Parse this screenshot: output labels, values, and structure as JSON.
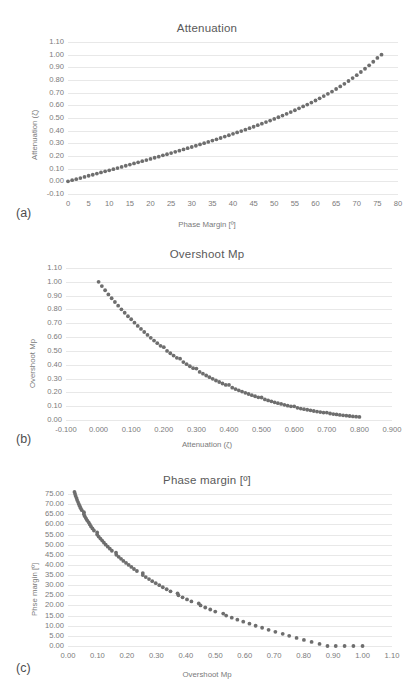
{
  "document": {
    "background": "#ffffff",
    "series_color": "#6e6e6e",
    "grid_color": "#e8e8e8",
    "text_color": "#7a7a7a"
  },
  "figures": [
    {
      "panel": "(a)",
      "chart_data": {
        "type": "scatter",
        "title": "Attenuation",
        "xlabel": "Phase Margin [º]",
        "ylabel": "Attenuation (ζ)",
        "xlim": [
          0,
          80
        ],
        "ylim": [
          -0.1,
          1.1
        ],
        "xticks": [
          "0",
          "5",
          "10",
          "15",
          "20",
          "25",
          "30",
          "35",
          "40",
          "45",
          "50",
          "55",
          "60",
          "65",
          "70",
          "75",
          "80"
        ],
        "yticks": [
          "1.10",
          "1.00",
          "0.90",
          "0.80",
          "0.70",
          "0.60",
          "0.50",
          "0.40",
          "0.30",
          "0.20",
          "0.10",
          "0.00",
          "-0.10"
        ],
        "grid": true,
        "legend": "none",
        "x": [
          0.0,
          1.0,
          2.0,
          3.0,
          4.0,
          5.0,
          6.0,
          7.0,
          8.0,
          9.0,
          10.0,
          11.0,
          12.0,
          13.0,
          14.0,
          15.0,
          16.0,
          17.0,
          18.0,
          19.0,
          20.0,
          21.0,
          22.0,
          23.0,
          24.0,
          25.0,
          26.0,
          27.0,
          28.0,
          29.0,
          30.0,
          31.0,
          32.0,
          33.0,
          34.0,
          35.0,
          36.0,
          37.0,
          38.0,
          39.0,
          40.0,
          41.0,
          42.0,
          43.0,
          44.0,
          45.0,
          46.0,
          47.0,
          48.0,
          49.0,
          50.0,
          51.0,
          52.0,
          53.0,
          54.0,
          55.0,
          56.0,
          57.0,
          58.0,
          59.0,
          60.0,
          61.0,
          62.0,
          63.0,
          64.0,
          65.0,
          66.0,
          67.0,
          68.0,
          69.0,
          70.0,
          71.0,
          72.0,
          73.0,
          74.0,
          75.0,
          76.0
        ],
        "y": [
          0.0,
          0.009,
          0.017,
          0.026,
          0.035,
          0.044,
          0.052,
          0.061,
          0.07,
          0.079,
          0.087,
          0.096,
          0.105,
          0.114,
          0.123,
          0.132,
          0.141,
          0.15,
          0.159,
          0.168,
          0.177,
          0.186,
          0.195,
          0.205,
          0.214,
          0.223,
          0.233,
          0.242,
          0.252,
          0.262,
          0.271,
          0.281,
          0.291,
          0.301,
          0.311,
          0.322,
          0.332,
          0.342,
          0.353,
          0.364,
          0.375,
          0.386,
          0.397,
          0.408,
          0.42,
          0.431,
          0.443,
          0.455,
          0.468,
          0.48,
          0.493,
          0.506,
          0.519,
          0.533,
          0.547,
          0.561,
          0.576,
          0.591,
          0.606,
          0.622,
          0.638,
          0.655,
          0.673,
          0.691,
          0.709,
          0.729,
          0.749,
          0.77,
          0.792,
          0.815,
          0.838,
          0.863,
          0.889,
          0.916,
          0.944,
          0.974,
          1.0
        ]
      }
    },
    {
      "panel": "(b)",
      "chart_data": {
        "type": "scatter",
        "title": "Overshoot Mp",
        "xlabel": "Attenuation (ζ)",
        "ylabel": "Overshoot Mp",
        "xlim": [
          -0.1,
          0.9
        ],
        "ylim": [
          0.0,
          1.1
        ],
        "xticks": [
          "-0.100",
          "0.000",
          "0.100",
          "0.200",
          "0.300",
          "0.400",
          "0.500",
          "0.600",
          "0.700",
          "0.800",
          "0.900"
        ],
        "yticks": [
          "1.10",
          "1.00",
          "0.90",
          "0.80",
          "0.70",
          "0.60",
          "0.50",
          "0.40",
          "0.30",
          "0.20",
          "0.10",
          "0.00"
        ],
        "grid": true,
        "legend": "none",
        "x": [
          0.0,
          0.01,
          0.02,
          0.03,
          0.04,
          0.05,
          0.06,
          0.07,
          0.08,
          0.09,
          0.1,
          0.11,
          0.12,
          0.13,
          0.14,
          0.15,
          0.16,
          0.17,
          0.18,
          0.19,
          0.2,
          0.21,
          0.22,
          0.23,
          0.24,
          0.25,
          0.26,
          0.27,
          0.28,
          0.29,
          0.3,
          0.31,
          0.32,
          0.33,
          0.34,
          0.35,
          0.36,
          0.37,
          0.38,
          0.39,
          0.4,
          0.41,
          0.42,
          0.43,
          0.44,
          0.45,
          0.46,
          0.47,
          0.48,
          0.49,
          0.5,
          0.51,
          0.52,
          0.53,
          0.54,
          0.55,
          0.56,
          0.57,
          0.58,
          0.59,
          0.6,
          0.61,
          0.62,
          0.63,
          0.64,
          0.65,
          0.66,
          0.67,
          0.68,
          0.69,
          0.7,
          0.71,
          0.72,
          0.73,
          0.74,
          0.75,
          0.76,
          0.77,
          0.78,
          0.79,
          0.8
        ],
        "y": [
          1.0,
          0.969,
          0.939,
          0.909,
          0.881,
          0.854,
          0.827,
          0.801,
          0.776,
          0.751,
          0.729,
          0.704,
          0.681,
          0.659,
          0.637,
          0.616,
          0.595,
          0.575,
          0.556,
          0.537,
          0.527,
          0.5,
          0.483,
          0.466,
          0.45,
          0.444,
          0.419,
          0.404,
          0.389,
          0.375,
          0.372,
          0.348,
          0.335,
          0.322,
          0.31,
          0.298,
          0.286,
          0.275,
          0.264,
          0.254,
          0.254,
          0.234,
          0.224,
          0.215,
          0.206,
          0.197,
          0.188,
          0.18,
          0.172,
          0.164,
          0.163,
          0.149,
          0.142,
          0.135,
          0.128,
          0.122,
          0.116,
          0.11,
          0.104,
          0.099,
          0.099,
          0.088,
          0.083,
          0.078,
          0.074,
          0.07,
          0.065,
          0.061,
          0.057,
          0.054,
          0.054,
          0.047,
          0.043,
          0.04,
          0.037,
          0.034,
          0.031,
          0.029,
          0.026,
          0.024,
          0.022
        ]
      }
    },
    {
      "panel": "(c)",
      "chart_data": {
        "type": "scatter",
        "title": "Phase margin [º]",
        "xlabel": "Overshoot Mp",
        "ylabel": "Phse margin [º]",
        "xlim": [
          0.0,
          1.1
        ],
        "ylim": [
          0.0,
          75.0
        ],
        "xticks": [
          "0.00",
          "0.10",
          "0.20",
          "0.30",
          "0.40",
          "0.50",
          "0.60",
          "0.70",
          "0.80",
          "0.90",
          "1.00",
          "1.10"
        ],
        "yticks": [
          "75.00",
          "70.00",
          "65.00",
          "60.00",
          "55.00",
          "50.00",
          "45.00",
          "40.00",
          "35.00",
          "30.00",
          "25.00",
          "20.00",
          "15.00",
          "10.00",
          "5.00",
          "0.00"
        ],
        "grid": true,
        "legend": "none",
        "x": [
          0.022,
          0.024,
          0.026,
          0.029,
          0.031,
          0.034,
          0.037,
          0.04,
          0.043,
          0.047,
          0.054,
          0.054,
          0.057,
          0.061,
          0.065,
          0.07,
          0.074,
          0.078,
          0.083,
          0.088,
          0.099,
          0.099,
          0.104,
          0.11,
          0.116,
          0.122,
          0.128,
          0.135,
          0.142,
          0.149,
          0.163,
          0.164,
          0.172,
          0.18,
          0.188,
          0.197,
          0.206,
          0.215,
          0.224,
          0.234,
          0.254,
          0.254,
          0.264,
          0.275,
          0.286,
          0.298,
          0.31,
          0.322,
          0.335,
          0.348,
          0.372,
          0.375,
          0.389,
          0.404,
          0.419,
          0.444,
          0.45,
          0.466,
          0.483,
          0.5,
          0.527,
          0.537,
          0.556,
          0.575,
          0.595,
          0.616,
          0.637,
          0.659,
          0.681,
          0.704,
          0.729,
          0.751,
          0.776,
          0.801,
          0.827,
          0.854,
          0.881,
          0.909,
          0.939,
          0.969,
          1.0
        ],
        "y": [
          76.0,
          75.0,
          74.0,
          73.0,
          72.0,
          71.0,
          70.0,
          69.0,
          68.0,
          67.0,
          66.0,
          65.0,
          64.0,
          63.0,
          62.0,
          61.0,
          60.0,
          59.0,
          58.0,
          57.0,
          56.0,
          55.0,
          54.0,
          53.0,
          52.0,
          51.0,
          50.0,
          49.0,
          48.0,
          47.0,
          46.0,
          45.0,
          44.0,
          43.0,
          42.0,
          41.0,
          40.0,
          39.0,
          38.0,
          37.0,
          36.0,
          35.0,
          34.0,
          33.0,
          32.0,
          31.0,
          30.0,
          29.0,
          28.0,
          27.0,
          26.0,
          25.0,
          24.0,
          23.0,
          22.0,
          21.0,
          20.0,
          19.0,
          18.0,
          17.0,
          16.0,
          15.0,
          14.0,
          13.0,
          12.0,
          11.0,
          10.0,
          9.0,
          8.0,
          7.0,
          6.0,
          5.0,
          4.0,
          3.0,
          2.0,
          1.0,
          0.0,
          0.0,
          0.0,
          0.0,
          0.0
        ]
      }
    }
  ]
}
